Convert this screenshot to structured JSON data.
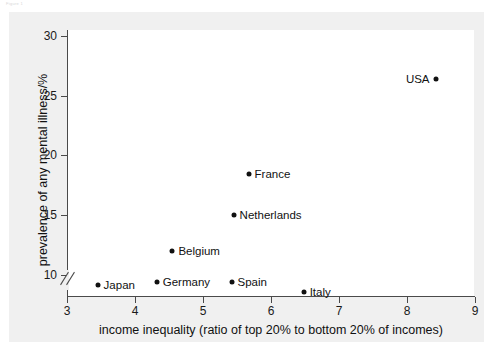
{
  "top_caption": "Figure 1",
  "chart_data": {
    "type": "scatter",
    "title": "",
    "xlabel": "income inequality (ratio of top 20% to bottom 20% of incomes)",
    "ylabel": "prevalence of any mental illness/%",
    "xlim": [
      3,
      9
    ],
    "ylim": [
      8.2,
      30.5
    ],
    "xticks": [
      3,
      4,
      5,
      6,
      7,
      8,
      9
    ],
    "xtick_labels": [
      "3",
      "4",
      "5",
      "6",
      "7",
      "8",
      "9"
    ],
    "yticks": [
      10,
      15,
      20,
      25,
      30
    ],
    "ytick_labels": [
      "10",
      "15",
      "20",
      "25",
      "30"
    ],
    "grid": false,
    "legend": "none",
    "axis_break": {
      "axis": "y",
      "below": 10
    },
    "marker": "filled-circle",
    "marker_color": "#111111",
    "points": [
      {
        "label": "Japan",
        "x": 3.45,
        "y": 9.1,
        "label_side": "right"
      },
      {
        "label": "Germany",
        "x": 4.32,
        "y": 9.4,
        "label_side": "right"
      },
      {
        "label": "Belgium",
        "x": 4.55,
        "y": 12.0,
        "label_side": "right"
      },
      {
        "label": "Spain",
        "x": 5.42,
        "y": 9.4,
        "label_side": "right"
      },
      {
        "label": "Netherlands",
        "x": 5.45,
        "y": 15.0,
        "label_side": "right"
      },
      {
        "label": "France",
        "x": 5.67,
        "y": 18.4,
        "label_side": "right"
      },
      {
        "label": "Italy",
        "x": 6.48,
        "y": 8.5,
        "label_side": "right"
      },
      {
        "label": "USA",
        "x": 8.42,
        "y": 26.4,
        "label_side": "left"
      }
    ]
  }
}
